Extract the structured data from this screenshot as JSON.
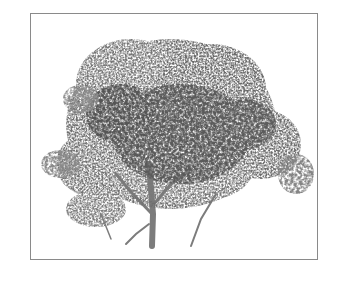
{
  "image": {
    "subject": "Tree",
    "style": "grayscale stippled foliage",
    "colors": {
      "frame_border": "#8a8a8a",
      "background": "#ffffff",
      "foliage_dark": "#5a5a5a",
      "foliage_mid": "#7a7a7a",
      "foliage_light": "#a5a5a5",
      "trunk": "#7c7c7c"
    }
  }
}
